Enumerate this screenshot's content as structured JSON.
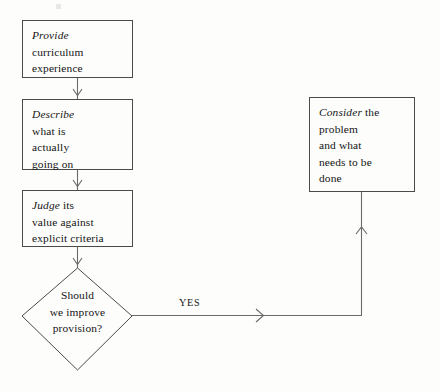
{
  "diagram": {
    "type": "flowchart",
    "stroke_color": "#4a4a4a",
    "text_color": "#141414",
    "background_color": "#fdfdfc",
    "nodes": [
      {
        "id": "provide",
        "shape": "rectangle",
        "lead": "Provide",
        "lines": [
          "curriculum",
          "experience"
        ]
      },
      {
        "id": "describe",
        "shape": "rectangle",
        "lead": "Describe",
        "lines": [
          "what is",
          "actually",
          "going on"
        ]
      },
      {
        "id": "judge",
        "shape": "rectangle",
        "lead": "Judge",
        "lead_tail": " its",
        "lines": [
          "value against",
          "explicit criteria"
        ]
      },
      {
        "id": "decision",
        "shape": "diamond",
        "lines": [
          "Should",
          "we improve",
          "provision?"
        ]
      },
      {
        "id": "consider",
        "shape": "rectangle",
        "lead": "Consider",
        "lead_tail": " the",
        "lines": [
          "problem",
          "and what",
          "needs to be",
          "done"
        ]
      }
    ],
    "edges": [
      {
        "id": "provide-to-describe",
        "label": ""
      },
      {
        "id": "describe-to-judge",
        "label": ""
      },
      {
        "id": "judge-to-decision",
        "label": ""
      },
      {
        "id": "decision-to-consider",
        "label": "YES"
      }
    ]
  }
}
